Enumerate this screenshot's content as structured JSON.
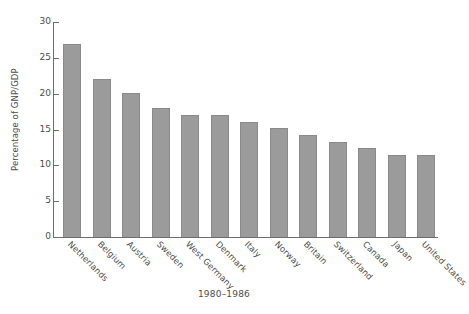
{
  "chart_data": {
    "type": "bar",
    "title": "",
    "subtitle": "",
    "xlabel": "1980–1986",
    "ylabel": "Percentage of GNP/GDP",
    "categories": [
      "Netherlands",
      "Belgium",
      "Austria",
      "Sweden",
      "West Germany",
      "Denmark",
      "Italy",
      "Norway",
      "Britain",
      "Switzerland",
      "Canada",
      "Japan",
      "United States"
    ],
    "values": [
      27.0,
      22.0,
      20.1,
      18.0,
      17.0,
      17.0,
      16.0,
      15.2,
      14.2,
      13.3,
      12.4,
      11.4,
      11.4
    ],
    "ylim": [
      0,
      30
    ],
    "yticks": [
      0,
      5,
      10,
      15,
      20,
      25,
      30
    ],
    "ytick_labels": [
      "0",
      "5",
      "10",
      "15",
      "20",
      "25",
      "30"
    ],
    "grid": false,
    "legend": null,
    "legend_position": "none",
    "bar_color": "#9b9b9b",
    "bar_edge_color": "#8a8a8a",
    "axis_color": "#6d6d6d",
    "text_color": "#4c4c4c",
    "background_color": "#ffffff"
  }
}
